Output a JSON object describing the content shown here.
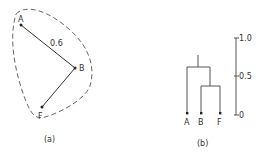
{
  "panel_a": {
    "caption": "(a)",
    "nodes": [
      {
        "id": "A",
        "label": "A",
        "x": 21,
        "y": 25
      },
      {
        "id": "B",
        "label": "B",
        "x": 75,
        "y": 68
      },
      {
        "id": "F",
        "label": "F",
        "x": 42,
        "y": 107
      }
    ],
    "edges": [
      {
        "from": "A",
        "to": "B",
        "label": "0.6"
      },
      {
        "from": "B",
        "to": "F",
        "label": ""
      }
    ],
    "cluster_outline": "dashed"
  },
  "panel_b": {
    "caption": "(b)",
    "leaves": [
      "A",
      "B",
      "F"
    ],
    "scale": {
      "ticks": [
        "1.0",
        "0.5",
        "0"
      ]
    },
    "merges": [
      {
        "children": [
          "B",
          "F"
        ],
        "height": 0.38
      },
      {
        "children": [
          "A",
          "BF"
        ],
        "height": 0.62
      }
    ]
  },
  "colors": {
    "ink": "#333333",
    "background": "#ffffff"
  }
}
